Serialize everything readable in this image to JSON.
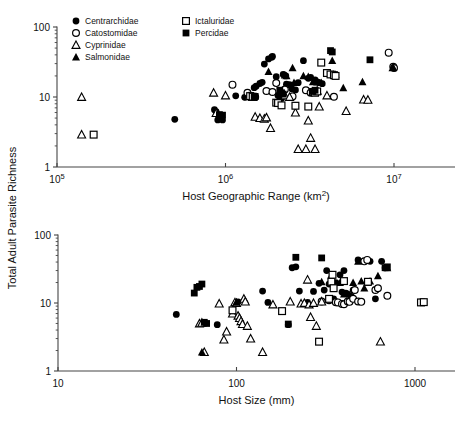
{
  "figure": {
    "y_axis_label": "Total Adult Parasite Richness",
    "panels": [
      "top",
      "bottom"
    ]
  },
  "legend": {
    "entries": [
      {
        "label": "Centrarchidae",
        "marker": "filled-circle",
        "column": 1
      },
      {
        "label": "Catostomidae",
        "marker": "open-circle",
        "column": 1
      },
      {
        "label": "Cyprinidae",
        "marker": "open-triangle",
        "column": 1
      },
      {
        "label": "Salmonidae",
        "marker": "filled-triangle",
        "column": 1
      },
      {
        "label": "Ictaluridae",
        "marker": "open-square",
        "column": 2
      },
      {
        "label": "Percidae",
        "marker": "filled-square",
        "column": 2
      }
    ]
  },
  "colors": {
    "marker": "#000000",
    "axis": "#444444",
    "background": "#ffffff"
  },
  "chart_data": [
    {
      "type": "scatter",
      "panel": "top",
      "title": "",
      "xlabel": "Host Geographic Range (km2)",
      "ylabel": "Total Adult Parasite Richness",
      "xscale": "log",
      "yscale": "log",
      "xlim": [
        100000,
        12000000
      ],
      "ylim": [
        1,
        100
      ],
      "xticks": [
        100000,
        1000000,
        10000000
      ],
      "xticklabels": [
        "10^5",
        "10^6",
        "10^7"
      ],
      "yticks": [
        1,
        10,
        100
      ],
      "yticklabels": [
        "1",
        "10",
        "100"
      ],
      "grid": false,
      "legend_position": "top-left",
      "series": [
        {
          "name": "Centrarchidae",
          "marker": "filled-circle",
          "points": [
            [
              500000,
              4.8
            ],
            [
              860000,
              6.6
            ],
            [
              880000,
              6.2
            ],
            [
              900000,
              4.7
            ],
            [
              960000,
              4.7
            ],
            [
              1150000,
              10.4
            ],
            [
              1300000,
              9.9
            ],
            [
              1480000,
              13.6
            ],
            [
              1520000,
              14.3
            ],
            [
              1600000,
              15.6
            ],
            [
              1650000,
              16.2
            ],
            [
              1700000,
              29.5
            ],
            [
              1800000,
              35
            ],
            [
              1880000,
              37
            ],
            [
              1900000,
              38
            ],
            [
              2000000,
              19.5
            ],
            [
              2050000,
              10.5
            ],
            [
              2100000,
              10.2
            ],
            [
              2150000,
              9.5
            ],
            [
              2200000,
              21
            ],
            [
              2280000,
              20
            ],
            [
              2300000,
              15.2
            ],
            [
              2400000,
              15
            ],
            [
              2480000,
              13
            ],
            [
              2600000,
              12.6
            ],
            [
              2700000,
              16
            ],
            [
              2900000,
              33
            ],
            [
              3100000,
              18.5
            ],
            [
              3200000,
              19
            ],
            [
              3400000,
              17.5
            ],
            [
              3500000,
              16.5
            ],
            [
              3600000,
              16
            ],
            [
              3750000,
              15.5
            ]
          ]
        },
        {
          "name": "Catostomidae",
          "marker": "open-circle",
          "points": [
            [
              1100000,
              15
            ],
            [
              1350000,
              11.5
            ],
            [
              1420000,
              10.3
            ],
            [
              1500000,
              10.0
            ],
            [
              1750000,
              12.2
            ],
            [
              1900000,
              11.8
            ],
            [
              2000000,
              15.8
            ],
            [
              2250000,
              12.8
            ],
            [
              2500000,
              10.2
            ],
            [
              3000000,
              12.5
            ],
            [
              3200000,
              11.5
            ],
            [
              4400000,
              10.1
            ],
            [
              9300000,
              43
            ],
            [
              9900000,
              27
            ],
            [
              10000000,
              26
            ]
          ]
        },
        {
          "name": "Cyprinidae",
          "marker": "open-triangle",
          "points": [
            [
              140000,
              10.0
            ],
            [
              140000,
              2.9
            ],
            [
              850000,
              11.5
            ],
            [
              880000,
              5.9
            ],
            [
              1000000,
              10.5
            ],
            [
              1380000,
              10.2
            ],
            [
              1450000,
              10.0
            ],
            [
              1500000,
              5.2
            ],
            [
              1600000,
              5.0
            ],
            [
              1700000,
              4.9
            ],
            [
              1750000,
              5.1
            ],
            [
              1850000,
              3.6
            ],
            [
              2250000,
              10.5
            ],
            [
              2400000,
              10.0
            ],
            [
              2600000,
              6.0
            ],
            [
              2700000,
              1.8
            ],
            [
              3000000,
              1.8
            ],
            [
              3100000,
              4.6
            ],
            [
              3200000,
              2.6
            ],
            [
              3300000,
              11.8
            ],
            [
              3400000,
              1.8
            ],
            [
              3500000,
              12.3
            ],
            [
              3600000,
              7.3
            ],
            [
              4000000,
              10.5
            ],
            [
              5200000,
              6.3
            ],
            [
              6600000,
              9.2
            ],
            [
              7000000,
              9.1
            ]
          ]
        },
        {
          "name": "Salmonidae",
          "marker": "filled-triangle",
          "points": [
            [
              1450000,
              10.0
            ],
            [
              1480000,
              10.1
            ],
            [
              1800000,
              23
            ],
            [
              2250000,
              20.5
            ],
            [
              2300000,
              20
            ],
            [
              2500000,
              26
            ],
            [
              2550000,
              16
            ],
            [
              2900000,
              20
            ],
            [
              3100000,
              19.5
            ],
            [
              3300000,
              16.5
            ],
            [
              3500000,
              16.3
            ],
            [
              3700000,
              16
            ],
            [
              4300000,
              33
            ],
            [
              4400000,
              21
            ],
            [
              4500000,
              21
            ],
            [
              5000000,
              13.5
            ],
            [
              6500000,
              16.5
            ],
            [
              9800000,
              26
            ],
            [
              9900000,
              26.5
            ]
          ]
        },
        {
          "name": "Ictaluridae",
          "marker": "open-square",
          "points": [
            [
              165000,
              2.9
            ],
            [
              1400000,
              10.3
            ],
            [
              1450000,
              10.1
            ],
            [
              2000000,
              8.3
            ],
            [
              2050000,
              8.2
            ],
            [
              2150000,
              7.6
            ],
            [
              2600000,
              7.5
            ],
            [
              3100000,
              7.3
            ],
            [
              3300000,
              11.8
            ],
            [
              3400000,
              11.5
            ],
            [
              3500000,
              12.0
            ],
            [
              3700000,
              31
            ],
            [
              4000000,
              22
            ],
            [
              4200000,
              21
            ],
            [
              4400000,
              20.5
            ],
            [
              4500000,
              20
            ]
          ]
        },
        {
          "name": "Percidae",
          "marker": "filled-square",
          "points": [
            [
              920000,
              5.6
            ],
            [
              960000,
              5.5
            ],
            [
              1480000,
              10.0
            ],
            [
              1500000,
              10.2
            ],
            [
              2100000,
              12.5
            ],
            [
              2150000,
              11.5
            ],
            [
              2200000,
              11.0
            ],
            [
              3300000,
              12.0
            ],
            [
              3400000,
              12.5
            ],
            [
              4200000,
              46
            ],
            [
              4300000,
              44
            ],
            [
              7200000,
              34
            ]
          ]
        }
      ]
    },
    {
      "type": "scatter",
      "panel": "bottom",
      "title": "",
      "xlabel": "Host Size (mm)",
      "ylabel": "Total Adult Parasite Richness",
      "xscale": "log",
      "yscale": "log",
      "xlim": [
        10,
        1500
      ],
      "ylim": [
        1,
        100
      ],
      "xticks": [
        10,
        100,
        1000
      ],
      "xticklabels": [
        "10",
        "100",
        "1000"
      ],
      "yticks": [
        1,
        10,
        100
      ],
      "yticklabels": [
        "1",
        "10",
        "100"
      ],
      "grid": false,
      "legend_position": "none",
      "series": [
        {
          "name": "Centrarchidae",
          "marker": "filled-circle",
          "points": [
            [
              46,
              6.8
            ],
            [
              78,
              4.8
            ],
            [
              100,
              10.2
            ],
            [
              102,
              10.4
            ],
            [
              140,
              15
            ],
            [
              150,
              10.2
            ],
            [
              195,
              4.8
            ],
            [
              205,
              33
            ],
            [
              215,
              34
            ],
            [
              225,
              15
            ],
            [
              250,
              10.2
            ],
            [
              270,
              14.8
            ],
            [
              290,
              19.5
            ],
            [
              300,
              10.5
            ],
            [
              310,
              15.5
            ],
            [
              320,
              30
            ],
            [
              330,
              19
            ],
            [
              350,
              11.5
            ],
            [
              360,
              20
            ],
            [
              380,
              26
            ],
            [
              390,
              14.5
            ],
            [
              400,
              30
            ],
            [
              410,
              14.0
            ],
            [
              420,
              13.5
            ],
            [
              440,
              12.5
            ],
            [
              450,
              15.5
            ],
            [
              480,
              43
            ],
            [
              560,
              41
            ],
            [
              600,
              11.5
            ],
            [
              650,
              41
            ],
            [
              680,
              33
            ]
          ]
        },
        {
          "name": "Catostomidae",
          "marker": "open-circle",
          "points": [
            [
              300,
              10.5
            ],
            [
              330,
              11.0
            ],
            [
              360,
              10.3
            ],
            [
              370,
              10.2
            ],
            [
              390,
              9.7
            ],
            [
              400,
              9.6
            ],
            [
              420,
              10.5
            ],
            [
              430,
              10.4
            ],
            [
              450,
              11.5
            ],
            [
              460,
              15.5
            ],
            [
              480,
              10.5
            ],
            [
              500,
              10.4
            ],
            [
              520,
              41
            ],
            [
              540,
              43
            ],
            [
              600,
              15.5
            ],
            [
              620,
              16.5
            ],
            [
              700,
              12.8
            ]
          ]
        },
        {
          "name": "Cyprinidae",
          "marker": "open-triangle",
          "points": [
            [
              62,
              5.0
            ],
            [
              64,
              5.1
            ],
            [
              66,
              1.9
            ],
            [
              80,
              9.8
            ],
            [
              85,
              2.9
            ],
            [
              88,
              3.8
            ],
            [
              95,
              7.0
            ],
            [
              98,
              10.2
            ],
            [
              100,
              10.0
            ],
            [
              102,
              6.5
            ],
            [
              104,
              6.0
            ],
            [
              106,
              5.4
            ],
            [
              108,
              4.9
            ],
            [
              110,
              11.5
            ],
            [
              112,
              10.5
            ],
            [
              115,
              4.6
            ],
            [
              120,
              3.0
            ],
            [
              140,
              1.9
            ],
            [
              160,
              9.5
            ],
            [
              200,
              10.5
            ],
            [
              230,
              9.8
            ],
            [
              240,
              10.0
            ],
            [
              250,
              22
            ],
            [
              255,
              9.5
            ],
            [
              260,
              6.2
            ],
            [
              270,
              10.0
            ],
            [
              280,
              4.6
            ],
            [
              300,
              10.5
            ],
            [
              640,
              2.7
            ]
          ]
        },
        {
          "name": "Salmonidae",
          "marker": "filled-triangle",
          "points": [
            [
              64,
              1.9
            ],
            [
              100,
              10.2
            ],
            [
              300,
              20.5
            ],
            [
              340,
              26
            ],
            [
              350,
              21
            ],
            [
              380,
              20
            ],
            [
              400,
              13.5
            ],
            [
              450,
              20
            ],
            [
              480,
              41
            ],
            [
              500,
              21
            ],
            [
              520,
              16.5
            ],
            [
              540,
              20
            ],
            [
              560,
              21
            ],
            [
              620,
              25
            ],
            [
              700,
              33
            ]
          ]
        },
        {
          "name": "Ictaluridae",
          "marker": "open-square",
          "points": [
            [
              95,
              7.8
            ],
            [
              180,
              7.6
            ],
            [
              290,
              2.7
            ],
            [
              330,
              11.5
            ],
            [
              340,
              20.5
            ],
            [
              345,
              26
            ],
            [
              350,
              16.5
            ],
            [
              400,
              21
            ],
            [
              545,
              20.5
            ],
            [
              1080,
              10.2
            ],
            [
              1120,
              10.3
            ]
          ]
        },
        {
          "name": "Percidae",
          "marker": "filled-square",
          "points": [
            [
              58,
              14
            ],
            [
              60,
              17
            ],
            [
              62,
              17.5
            ],
            [
              64,
              19
            ],
            [
              66,
              5.2
            ],
            [
              68,
              5.0
            ],
            [
              195,
              4.9
            ],
            [
              215,
              47
            ],
            [
              300,
              46
            ],
            [
              680,
              33
            ],
            [
              700,
              34
            ]
          ]
        }
      ]
    }
  ]
}
